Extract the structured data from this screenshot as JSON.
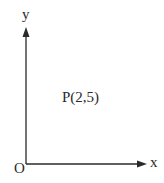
{
  "diagram": {
    "type": "coordinate-axes",
    "axes": {
      "x_label": "x",
      "y_label": "y",
      "origin_label": "O"
    },
    "point": {
      "label": "P(2,5)",
      "x": 2,
      "y": 5
    },
    "colors": {
      "line": "#2a2a2a",
      "background": "#ffffff"
    }
  }
}
